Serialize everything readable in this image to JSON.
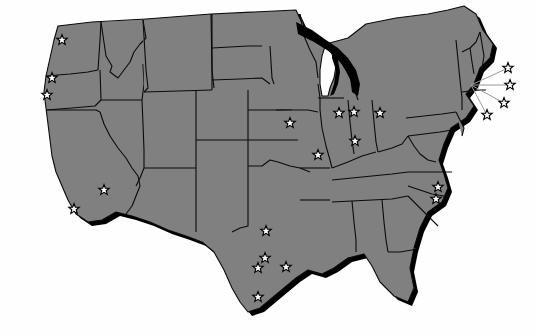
{
  "map": {
    "title": "United States Map with Star Markers",
    "region": "Contiguous United States",
    "projection": "conic",
    "colors": {
      "background": "#fefefe",
      "land_fill": "#808080",
      "border_stroke": "#0a0a0a",
      "drop_shadow": "#000000",
      "marker_fill": "#fdfdfd",
      "marker_stroke": "#000000",
      "leader_line": "#9a9a9a"
    },
    "style": {
      "marker_shape": "five-pointed-star",
      "marker_size_px": 11,
      "has_drop_shadow": true,
      "shadow_offset_px": 4,
      "labels_visible": false,
      "legend_visible": false
    },
    "marker_count": 22,
    "markers": [
      {
        "id": "marker-wa-1",
        "name": "marker-washington",
        "x": 62,
        "y": 40,
        "state": "WA",
        "has_leader": false
      },
      {
        "id": "marker-or-1",
        "name": "marker-oregon-north",
        "x": 52,
        "y": 78,
        "state": "OR",
        "has_leader": false
      },
      {
        "id": "marker-or-2",
        "name": "marker-oregon-south",
        "x": 47,
        "y": 95,
        "state": "OR",
        "has_leader": false
      },
      {
        "id": "marker-ca-1",
        "name": "marker-california-north",
        "x": 104,
        "y": 190,
        "state": "CA",
        "has_leader": false
      },
      {
        "id": "marker-ca-2",
        "name": "marker-california-south",
        "x": 74,
        "y": 209,
        "state": "CA",
        "has_leader": false
      },
      {
        "id": "marker-ia-1",
        "name": "marker-iowa",
        "x": 290,
        "y": 123,
        "state": "IA",
        "has_leader": false
      },
      {
        "id": "marker-il-1",
        "name": "marker-illinois-north",
        "x": 339,
        "y": 113,
        "state": "IL",
        "has_leader": false
      },
      {
        "id": "marker-mo-1",
        "name": "marker-missouri",
        "x": 318,
        "y": 155,
        "state": "MO",
        "has_leader": false
      },
      {
        "id": "marker-in-1",
        "name": "marker-indiana",
        "x": 355,
        "y": 141,
        "state": "IN",
        "has_leader": false
      },
      {
        "id": "marker-oh-1",
        "name": "marker-ohio",
        "x": 380,
        "y": 113,
        "state": "OH",
        "has_leader": false
      },
      {
        "id": "marker-tx-1",
        "name": "marker-texas-dallas",
        "x": 266,
        "y": 231,
        "state": "TX",
        "has_leader": false
      },
      {
        "id": "marker-tx-2",
        "name": "marker-texas-austin",
        "x": 265,
        "y": 258,
        "state": "TX",
        "has_leader": false
      },
      {
        "id": "marker-tx-3",
        "name": "marker-texas-san-antonio",
        "x": 258,
        "y": 268,
        "state": "TX",
        "has_leader": false
      },
      {
        "id": "marker-tx-4",
        "name": "marker-texas-houston",
        "x": 286,
        "y": 267,
        "state": "TX",
        "has_leader": false
      },
      {
        "id": "marker-tx-5",
        "name": "marker-texas-south",
        "x": 258,
        "y": 297,
        "state": "TX",
        "has_leader": false
      },
      {
        "id": "marker-nc-1",
        "name": "marker-north-carolina",
        "x": 438,
        "y": 187,
        "state": "NC",
        "has_leader": false
      },
      {
        "id": "marker-sc-1",
        "name": "marker-south-carolina",
        "x": 436,
        "y": 199,
        "state": "SC",
        "has_leader": false
      },
      {
        "id": "marker-ne-1",
        "name": "marker-new-england-1",
        "x": 508,
        "y": 68,
        "state": "MA",
        "has_leader": true,
        "anchor_x": 471,
        "anchor_y": 85
      },
      {
        "id": "marker-ne-2",
        "name": "marker-new-england-2",
        "x": 510,
        "y": 85,
        "state": "MA",
        "has_leader": true,
        "anchor_x": 471,
        "anchor_y": 85
      },
      {
        "id": "marker-ne-3",
        "name": "marker-new-england-3",
        "x": 504,
        "y": 103,
        "state": "RI",
        "has_leader": true,
        "anchor_x": 471,
        "anchor_y": 85
      },
      {
        "id": "marker-ne-4",
        "name": "marker-new-england-4",
        "x": 487,
        "y": 115,
        "state": "CT",
        "has_leader": true,
        "anchor_x": 471,
        "anchor_y": 85
      },
      {
        "id": "marker-mi-1",
        "name": "marker-michigan",
        "x": 354,
        "y": 112,
        "state": "MI",
        "has_leader": false
      }
    ]
  }
}
